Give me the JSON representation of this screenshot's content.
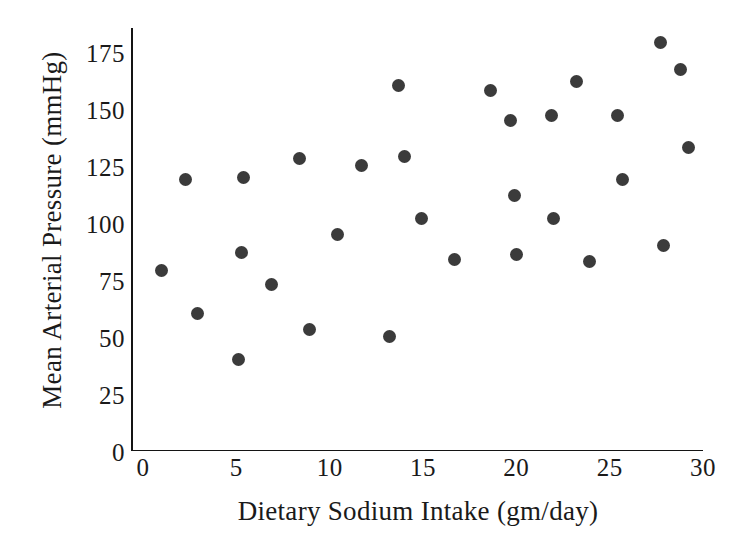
{
  "chart_data": {
    "type": "scatter",
    "title": "",
    "xlabel": "Dietary Sodium Intake (gm/day)",
    "ylabel": "Mean Arterial Pressure (mmHg)",
    "xlim": [
      0,
      30
    ],
    "ylim": [
      0,
      182
    ],
    "xticks": [
      0,
      5,
      10,
      15,
      20,
      25,
      30
    ],
    "xtick_labels": [
      "0",
      "5",
      "10",
      "15",
      "20",
      "25",
      "30"
    ],
    "yticks": [
      0,
      25,
      50,
      75,
      100,
      125,
      150,
      175
    ],
    "ytick_labels": [
      "0",
      "25",
      "50",
      "75",
      "100",
      "125",
      "150",
      "175"
    ],
    "grid": false,
    "legend": null,
    "marker": {
      "shape": "circle",
      "color": "#3b3b3b",
      "size_px": 13
    },
    "axis_color": "#141414",
    "background_color": "#ffffff",
    "n_points": 30,
    "x": [
      1.0,
      2.3,
      2.9,
      5.1,
      5.3,
      5.4,
      6.9,
      8.4,
      8.9,
      10.4,
      11.7,
      13.2,
      13.7,
      14.0,
      14.9,
      16.7,
      18.6,
      19.7,
      19.9,
      20.0,
      21.9,
      22.0,
      23.2,
      23.9,
      25.4,
      25.7,
      27.7,
      27.9,
      28.8,
      29.2
    ],
    "y": [
      80,
      120,
      61,
      41,
      88,
      121,
      74,
      129,
      54,
      96,
      126,
      51,
      161,
      130,
      103,
      85,
      159,
      146,
      113,
      87,
      148,
      103,
      163,
      84,
      148,
      120,
      180,
      91,
      168,
      134
    ],
    "points": [
      {
        "x": 1.0,
        "y": 80
      },
      {
        "x": 2.3,
        "y": 120
      },
      {
        "x": 2.9,
        "y": 61
      },
      {
        "x": 5.1,
        "y": 41
      },
      {
        "x": 5.3,
        "y": 88
      },
      {
        "x": 5.4,
        "y": 121
      },
      {
        "x": 6.9,
        "y": 74
      },
      {
        "x": 8.4,
        "y": 129
      },
      {
        "x": 8.9,
        "y": 54
      },
      {
        "x": 10.4,
        "y": 96
      },
      {
        "x": 11.7,
        "y": 126
      },
      {
        "x": 13.2,
        "y": 51
      },
      {
        "x": 13.7,
        "y": 161
      },
      {
        "x": 14.0,
        "y": 130
      },
      {
        "x": 14.9,
        "y": 103
      },
      {
        "x": 16.7,
        "y": 85
      },
      {
        "x": 18.6,
        "y": 159
      },
      {
        "x": 19.7,
        "y": 146
      },
      {
        "x": 19.9,
        "y": 113
      },
      {
        "x": 20.0,
        "y": 87
      },
      {
        "x": 21.9,
        "y": 148
      },
      {
        "x": 22.0,
        "y": 103
      },
      {
        "x": 23.2,
        "y": 163
      },
      {
        "x": 23.9,
        "y": 84
      },
      {
        "x": 25.4,
        "y": 148
      },
      {
        "x": 25.7,
        "y": 120
      },
      {
        "x": 27.7,
        "y": 180
      },
      {
        "x": 27.9,
        "y": 91
      },
      {
        "x": 28.8,
        "y": 168
      },
      {
        "x": 29.2,
        "y": 134
      }
    ]
  }
}
